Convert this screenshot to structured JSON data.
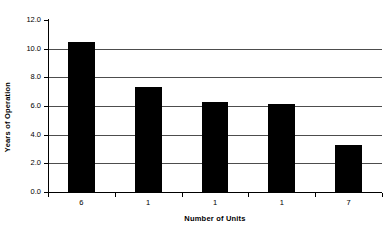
{
  "chart_data": {
    "type": "bar",
    "title": "",
    "xlabel": "Number of Units",
    "ylabel": "Years of Operation",
    "categories": [
      "6",
      "1",
      "1",
      "1",
      "7"
    ],
    "values": [
      10.5,
      7.35,
      6.3,
      6.15,
      3.3
    ],
    "ylim": [
      0.0,
      12.0
    ],
    "yticks": [
      "0.0",
      "2.0",
      "4.0",
      "6.0",
      "8.0",
      "10.0",
      "12.0"
    ],
    "ytick_values": [
      0.0,
      2.0,
      4.0,
      6.0,
      8.0,
      10.0,
      12.0
    ],
    "grid": true,
    "legend": false,
    "bar_color": "#000000",
    "gridline_color": "#4d4d4d",
    "axis_color": "#000000",
    "background_color": "#ffffff"
  }
}
